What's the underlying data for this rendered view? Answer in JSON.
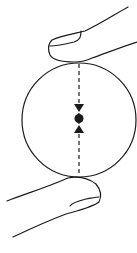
{
  "diagram": {
    "colors": {
      "stroke": "#1a1a1a",
      "background": "#ffffff"
    },
    "elements": {
      "top_finger": "finger pressing down on top of sphere",
      "sphere": "circle",
      "center_of_mass": "black dot at center",
      "force_line": "dashed vertical line through center",
      "arrow_down": "arrowhead pointing down toward center",
      "arrow_up": "arrowhead pointing up toward center",
      "bottom_finger": "finger pressing up on bottom of sphere"
    }
  }
}
